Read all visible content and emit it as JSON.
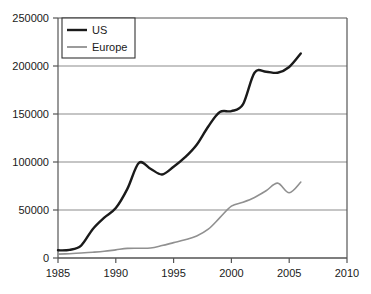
{
  "chart_data": {
    "type": "line",
    "title": "",
    "subtitle": "",
    "xlabel": "",
    "ylabel": "",
    "xlim": [
      1985,
      2010
    ],
    "ylim": [
      0,
      250000
    ],
    "xticks": [
      "1985",
      "1990",
      "1995",
      "2000",
      "2005",
      "2010"
    ],
    "xtick_values": [
      1985,
      1990,
      1995,
      2000,
      2005,
      2010
    ],
    "yticks": [
      "0",
      "50000",
      "100000",
      "150000",
      "200000",
      "250000"
    ],
    "ytick_values": [
      0,
      50000,
      100000,
      150000,
      200000,
      250000
    ],
    "grid": "horizontal",
    "legend_position": "top-left",
    "x": [
      1985,
      1986,
      1987,
      1988,
      1989,
      1990,
      1991,
      1992,
      1993,
      1994,
      1995,
      1996,
      1997,
      1998,
      1999,
      2000,
      2001,
      2002,
      2003,
      2004,
      2005,
      2006
    ],
    "series": [
      {
        "name": "US",
        "color": "#1a1a1a",
        "values": [
          8000,
          8500,
          13000,
          30000,
          42000,
          52000,
          72000,
          99000,
          93000,
          87000,
          95000,
          105000,
          118000,
          137000,
          152000,
          153000,
          160000,
          193000,
          194000,
          193000,
          199000,
          213000
        ]
      },
      {
        "name": "Europe",
        "color": "#909090",
        "values": [
          4000,
          4500,
          5200,
          6000,
          7000,
          8500,
          10000,
          10200,
          10500,
          13000,
          16000,
          19000,
          23000,
          30000,
          42000,
          54000,
          58000,
          63000,
          70000,
          78000,
          68000,
          79000
        ]
      }
    ]
  },
  "legend": {
    "items": [
      {
        "label": "US"
      },
      {
        "label": "Europe"
      }
    ]
  }
}
